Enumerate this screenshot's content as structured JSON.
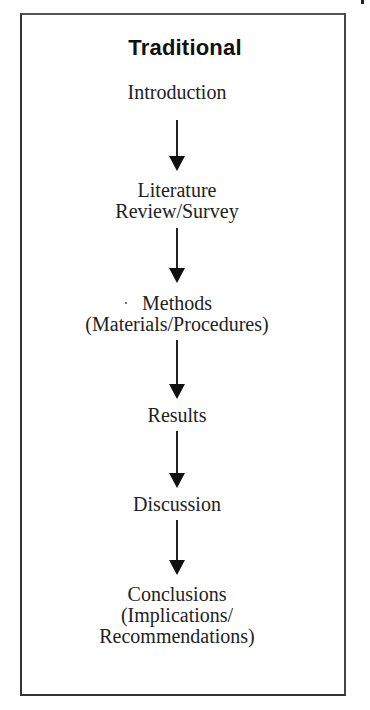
{
  "diagram": {
    "type": "flowchart",
    "direction": "top-to-bottom",
    "title": "Traditional",
    "steps": [
      {
        "id": "introduction",
        "lines": [
          "Introduction"
        ]
      },
      {
        "id": "literature-review",
        "lines": [
          "Literature",
          "Review/Survey"
        ]
      },
      {
        "id": "methods",
        "lines": [
          "Methods",
          "(Materials/Procedures)"
        ]
      },
      {
        "id": "results",
        "lines": [
          "Results"
        ]
      },
      {
        "id": "discussion",
        "lines": [
          "Discussion"
        ]
      },
      {
        "id": "conclusions",
        "lines": [
          "Conclusions",
          "(Implications/",
          "Recommendations)"
        ]
      }
    ],
    "edges": [
      {
        "from": "introduction",
        "to": "literature-review"
      },
      {
        "from": "literature-review",
        "to": "methods"
      },
      {
        "from": "methods",
        "to": "results"
      },
      {
        "from": "results",
        "to": "discussion"
      },
      {
        "from": "discussion",
        "to": "conclusions"
      }
    ],
    "colors": {
      "background": "#ffffff",
      "border": "#333333",
      "text": "#222222",
      "arrow": "#111111"
    }
  }
}
